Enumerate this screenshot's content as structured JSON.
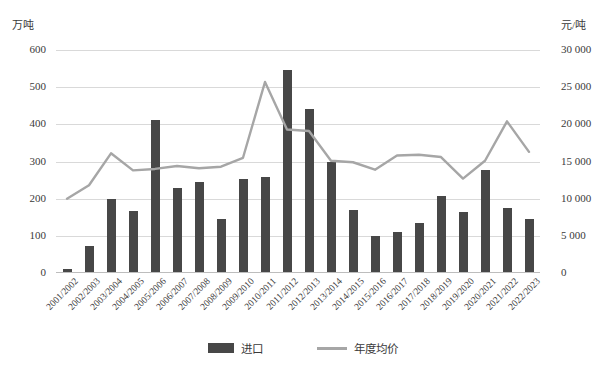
{
  "axes": {
    "left_unit": "万吨",
    "right_unit": "元/吨",
    "left_ticks": [
      "600",
      "500",
      "400",
      "300",
      "200",
      "100",
      "0"
    ],
    "right_ticks": [
      "30 000",
      "25 000",
      "20 000",
      "15 000",
      "10 000",
      "5 000",
      "0"
    ]
  },
  "legend": {
    "items": [
      {
        "label": "进口",
        "type": "bar",
        "color": "#474747"
      },
      {
        "label": "年度均价",
        "type": "line",
        "color": "#a6a6a6"
      }
    ]
  },
  "chart_data": {
    "type": "bar",
    "title": "",
    "xlabel": "",
    "ylabel": "万吨",
    "y2label": "元/吨",
    "ylim": [
      0,
      600
    ],
    "y2lim": [
      0,
      30000
    ],
    "grid": true,
    "legend_position": "bottom-center",
    "categories": [
      "2001/2002",
      "2002/2003",
      "2003/2004",
      "2004/2005",
      "2005/2006",
      "2006/2007",
      "2007/2008",
      "2008/2009",
      "2009/2010",
      "2010/2011",
      "2011/2012",
      "2012/2013",
      "2013/2014",
      "2014/2015",
      "2015/2016",
      "2016/2017",
      "2017/2018",
      "2018/2019",
      "2019/2020",
      "2020/2021",
      "2021/2022",
      "2022/2023"
    ],
    "series": [
      {
        "name": "进口",
        "type": "bar",
        "axis": "left",
        "unit": "万吨",
        "color": "#474747",
        "values": [
          10,
          73,
          200,
          166,
          412,
          228,
          245,
          146,
          253,
          258,
          546,
          441,
          300,
          170,
          99,
          111,
          134,
          206,
          163,
          277,
          175,
          145
        ]
      },
      {
        "name": "年度均价",
        "type": "line",
        "axis": "right",
        "unit": "元/吨",
        "color": "#a6a6a6",
        "values": [
          10000,
          11800,
          16100,
          13800,
          14000,
          14400,
          14100,
          14300,
          15500,
          25700,
          19300,
          19100,
          15100,
          14900,
          13900,
          15800,
          15900,
          15600,
          12700,
          15100,
          20400,
          16300
        ]
      }
    ]
  }
}
